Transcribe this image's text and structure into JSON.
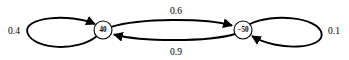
{
  "diagram": {
    "type": "state-transition-graph",
    "background_color": "#ffffff",
    "stroke_color": "#000000",
    "nodes": [
      {
        "id": "state-left",
        "label": "40",
        "cx": 103,
        "cy": 30,
        "r": 9
      },
      {
        "id": "state-right",
        "label": "−50",
        "cx": 243,
        "cy": 30,
        "r": 9
      }
    ],
    "edges": [
      {
        "id": "self-loop-left",
        "from": "state-left",
        "to": "state-left",
        "label": "0.4",
        "label_x": 14,
        "label_y": 30
      },
      {
        "id": "left-to-right",
        "from": "state-left",
        "to": "state-right",
        "label": "0.6",
        "label_x": 176,
        "label_y": 10
      },
      {
        "id": "right-to-left",
        "from": "state-right",
        "to": "state-left",
        "label": "0.9",
        "label_x": 176,
        "label_y": 51
      },
      {
        "id": "self-loop-right",
        "from": "state-right",
        "to": "state-right",
        "label": "0.1",
        "label_x": 334,
        "label_y": 30
      }
    ]
  }
}
